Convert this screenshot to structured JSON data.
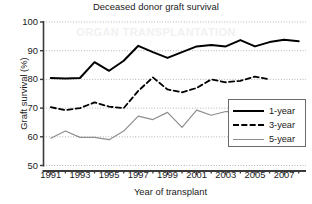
{
  "chart_data": {
    "type": "line",
    "title": "Deceased donor graft survival",
    "xlabel": "Year of transplant",
    "ylabel": "Graft survival (%)",
    "xlim": [
      1990.5,
      2008.5
    ],
    "ylim": [
      50,
      100
    ],
    "yticks": [
      50,
      60,
      70,
      80,
      90,
      100
    ],
    "xticks": [
      1991,
      1993,
      1995,
      1997,
      1999,
      2001,
      2003,
      2005,
      2007
    ],
    "grid": "horizontal-dotted",
    "legend_position": "lower-right",
    "series": [
      {
        "name": "1-year",
        "style": "solid",
        "color": "#000000",
        "width": 2.0,
        "x": [
          1991,
          1992,
          1993,
          1994,
          1995,
          1996,
          1997,
          1998,
          1999,
          2000,
          2001,
          2002,
          2003,
          2004,
          2005,
          2006,
          2007,
          2008
        ],
        "values": [
          80.5,
          80.3,
          80.5,
          86.0,
          83.0,
          86.5,
          91.7,
          89.5,
          87.5,
          89.5,
          91.5,
          92.0,
          91.5,
          93.7,
          91.5,
          93.0,
          93.8,
          93.3
        ]
      },
      {
        "name": "3-year",
        "style": "dashed",
        "color": "#000000",
        "width": 1.8,
        "x": [
          1991,
          1992,
          1993,
          1994,
          1995,
          1996,
          1997,
          1998,
          1999,
          2000,
          2001,
          2002,
          2003,
          2004,
          2005,
          2006
        ],
        "values": [
          70.3,
          69.3,
          70.0,
          72.0,
          70.5,
          70.0,
          76.0,
          80.7,
          76.5,
          75.5,
          77.0,
          80.0,
          79.0,
          79.5,
          81.0,
          80.0
        ]
      },
      {
        "name": "5-year",
        "style": "thin",
        "color": "#8e8e8e",
        "width": 1.2,
        "x": [
          1991,
          1992,
          1993,
          1994,
          1995,
          1996,
          1997,
          1998,
          1999,
          2000,
          2001,
          2002,
          2003,
          2004,
          2005,
          2006
        ],
        "values": [
          59.5,
          62.0,
          59.8,
          59.8,
          59.0,
          62.0,
          67.2,
          66.0,
          68.5,
          63.3,
          69.3,
          67.5,
          68.8,
          68.8,
          68.8,
          68.8
        ]
      }
    ],
    "legend_entries": [
      "1-year",
      "3-year",
      "5-year"
    ]
  },
  "watermark": {
    "text": "ORGAN TRANSPLANTATION"
  }
}
